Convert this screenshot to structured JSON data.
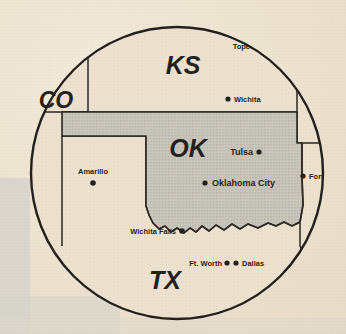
{
  "figure": {
    "kind": "locator-map",
    "medium": "scanned-print",
    "shape": "circular-inset",
    "region": "Southern Plains",
    "circle": {
      "cx": 177,
      "cy": 173,
      "r": 146
    }
  },
  "colors": {
    "paper": "#ece2cf",
    "ink": "#231f1c",
    "highlight_state_fill": "#c9c6bd",
    "neighbor_state_fill": "#ece2cf",
    "scan_band": "#d8d5cd"
  },
  "states": [
    {
      "abbr": "CO",
      "name": "Colorado",
      "label": "CO",
      "highlighted": false,
      "label_pos": {
        "x": 56,
        "y": 108
      },
      "label_size": 23
    },
    {
      "abbr": "KS",
      "name": "Kansas",
      "label": "KS",
      "highlighted": false,
      "label_pos": {
        "x": 183,
        "y": 74
      },
      "label_size": 25
    },
    {
      "abbr": "OK",
      "name": "Oklahoma",
      "label": "OK",
      "highlighted": true,
      "label_pos": {
        "x": 188,
        "y": 157
      },
      "label_size": 25
    },
    {
      "abbr": "TX",
      "name": "Texas",
      "label": "TX",
      "highlighted": false,
      "label_pos": {
        "x": 165,
        "y": 289
      },
      "label_size": 25
    }
  ],
  "cities": [
    {
      "name": "Topeka",
      "label": "Tope",
      "full_name": "Topeka",
      "clipped_by_circle": true,
      "dot": {
        "x": 260,
        "y": 46
      },
      "dot_visible": false,
      "label_pos": {
        "x": 250,
        "y": 49
      },
      "label_anchor": "end"
    },
    {
      "name": "Wichita",
      "label": "Wichita",
      "full_name": "Wichita",
      "clipped_by_circle": false,
      "dot": {
        "x": 228,
        "y": 99
      },
      "dot_visible": true,
      "label_pos": {
        "x": 234,
        "y": 102
      },
      "label_anchor": "start"
    },
    {
      "name": "Tulsa",
      "label": "Tulsa",
      "full_name": "Tulsa",
      "clipped_by_circle": false,
      "dot": {
        "x": 259,
        "y": 152
      },
      "dot_visible": true,
      "label_pos": {
        "x": 253,
        "y": 155
      },
      "label_anchor": "end"
    },
    {
      "name": "Fort Smith",
      "label": "Fort",
      "full_name": "Fort Smith",
      "clipped_by_circle": true,
      "dot": {
        "x": 303,
        "y": 176
      },
      "dot_visible": true,
      "label_pos": {
        "x": 309,
        "y": 179
      },
      "label_anchor": "start"
    },
    {
      "name": "Oklahoma City",
      "label": "Oklahoma City",
      "full_name": "Oklahoma City",
      "clipped_by_circle": false,
      "dot": {
        "x": 205,
        "y": 183
      },
      "dot_visible": true,
      "label_pos": {
        "x": 212,
        "y": 186
      },
      "label_anchor": "start"
    },
    {
      "name": "Amarillo",
      "label": "Amarillo",
      "full_name": "Amarillo",
      "clipped_by_circle": false,
      "dot": {
        "x": 93,
        "y": 183
      },
      "dot_visible": true,
      "label_pos": {
        "x": 93,
        "y": 174
      },
      "label_anchor": "middle"
    },
    {
      "name": "Wichita Falls",
      "label": "Wichita Falls",
      "full_name": "Wichita Falls",
      "clipped_by_circle": false,
      "dot": {
        "x": 182,
        "y": 231
      },
      "dot_visible": true,
      "label_pos": {
        "x": 176,
        "y": 234
      },
      "label_anchor": "end"
    },
    {
      "name": "Ft. Worth",
      "label": "Ft. Worth",
      "full_name": "Ft. Worth",
      "clipped_by_circle": false,
      "dot": {
        "x": 227,
        "y": 263
      },
      "dot_visible": true,
      "label_pos": {
        "x": 222,
        "y": 266
      },
      "label_anchor": "end"
    },
    {
      "name": "Dallas",
      "label": "Dallas",
      "full_name": "Dallas",
      "clipped_by_circle": false,
      "dot": {
        "x": 236,
        "y": 263
      },
      "dot_visible": true,
      "label_pos": {
        "x": 242,
        "y": 266
      },
      "label_anchor": "start"
    }
  ],
  "typography": {
    "city_label_size": 7.5,
    "city_dot_radius": 2.6
  }
}
